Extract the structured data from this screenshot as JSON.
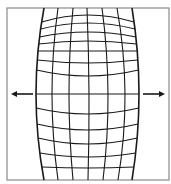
{
  "diagram": {
    "frame": {
      "x": 7,
      "y": 8,
      "width": 162,
      "height": 172,
      "stroke": "#8a8a8a"
    },
    "grid": {
      "color": "#1a1a1a",
      "center_y": 94,
      "vertical_lines": {
        "top_x": [
          44,
          58,
          73,
          87,
          102,
          117,
          132
        ],
        "middle_x": [
          36,
          52,
          69,
          89,
          108,
          125,
          139
        ],
        "bottom_x": [
          44,
          58,
          73,
          88,
          103,
          118,
          132
        ]
      },
      "horizontal_lines": {
        "center_y": [
          15,
          23,
          32,
          41,
          51,
          63,
          76,
          94,
          114,
          130,
          144,
          157,
          168
        ],
        "edge_y": [
          22,
          29,
          37,
          44,
          51,
          60,
          70,
          94,
          108,
          124,
          138,
          153,
          167
        ]
      }
    },
    "arrows": [
      {
        "name": "left-arrow",
        "direction": "left",
        "x1": 33,
        "x2": 11,
        "y": 94
      },
      {
        "name": "right-arrow",
        "direction": "right",
        "x1": 143,
        "x2": 165,
        "y": 94
      }
    ]
  }
}
